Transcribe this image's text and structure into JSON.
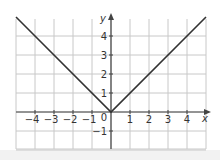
{
  "chart_data": {
    "type": "line",
    "title": "",
    "function": "y = |x|",
    "xlabel": "x",
    "ylabel": "y",
    "xlim": [
      -5,
      5
    ],
    "ylim": [
      -2,
      5
    ],
    "grid": true,
    "x_ticks": [
      -4,
      -3,
      -2,
      -1,
      1,
      2,
      3,
      4
    ],
    "y_ticks": [
      -1,
      1,
      2,
      3,
      4
    ],
    "origin_label": "0",
    "series": [
      {
        "name": "y = |x|",
        "x": [
          -5,
          0,
          5
        ],
        "y": [
          5,
          0,
          5
        ],
        "color": "#333333"
      }
    ]
  },
  "colors": {
    "grid": "#c8c8c8",
    "axis": "#444444",
    "line": "#333333"
  }
}
